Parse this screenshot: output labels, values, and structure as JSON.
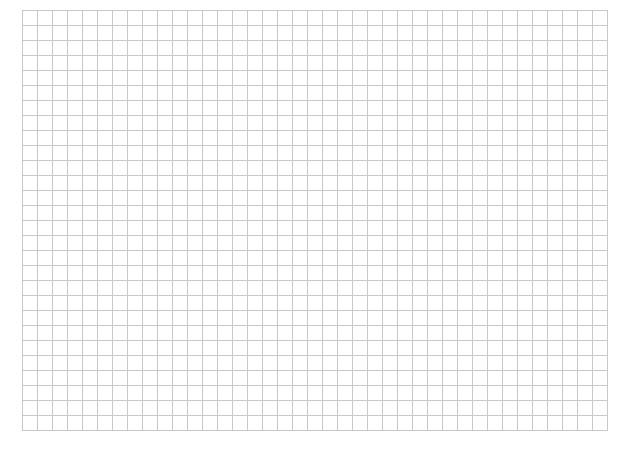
{
  "grid": {
    "left": 22,
    "top": 10,
    "cell_size": 15,
    "columns": 39,
    "rows": 28,
    "line_color": "#c8c8c8",
    "background": "#ffffff"
  }
}
